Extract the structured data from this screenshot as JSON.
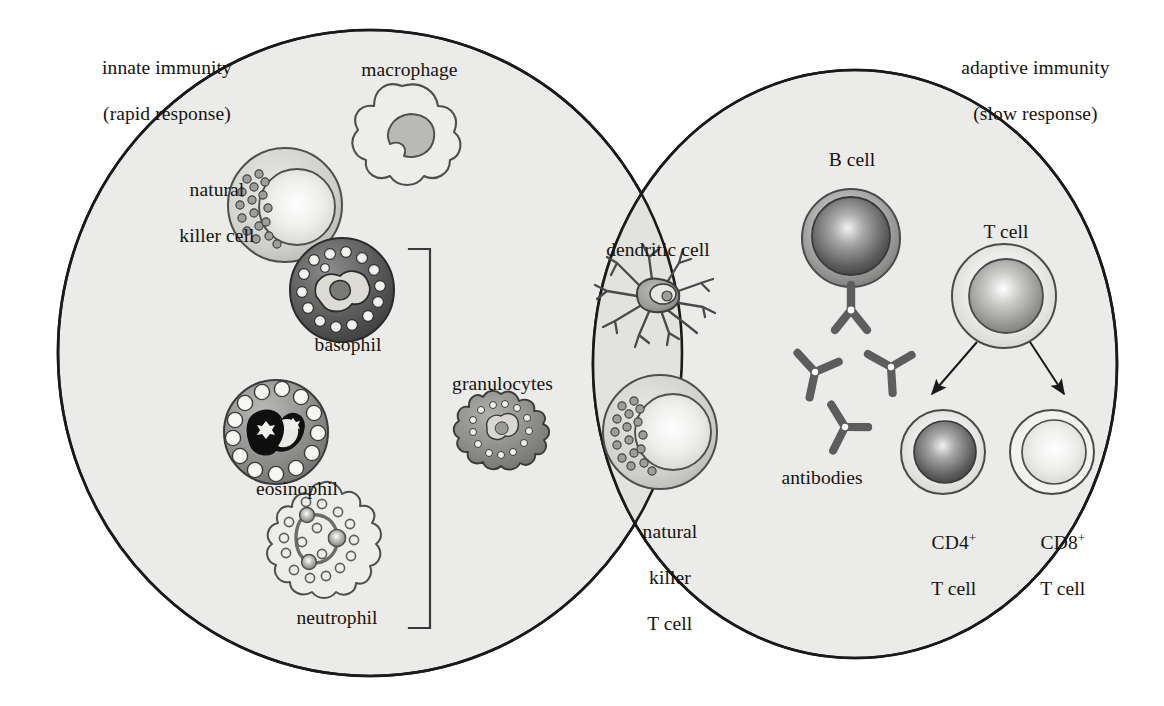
{
  "figure": {
    "background_color": "#ffffff",
    "ellipse_fill": "#ebebe9",
    "overlap_fill": "#e0e0dd",
    "outline_color": "#1a1a1a"
  },
  "regions": {
    "innate": {
      "label_line1": "innate immunity",
      "label_line2": "(rapid response)"
    },
    "adaptive": {
      "label_line1": "adaptive immunity",
      "label_line2": "(slow response)"
    }
  },
  "cells": {
    "macrophage": {
      "label": "macrophage"
    },
    "natural_killer_cell": {
      "label_line1": "natural",
      "label_line2": "killer cell"
    },
    "basophil": {
      "label": "basophil"
    },
    "eosinophil": {
      "label": "eosinophil"
    },
    "neutrophil": {
      "label": "neutrophil"
    },
    "granulocytes": {
      "label": "granulocytes"
    },
    "dendritic_cell": {
      "label": "dendritic cell"
    },
    "natural_killer_t_cell": {
      "label_line1": "natural",
      "label_line2": "killer",
      "label_line3": "T cell"
    },
    "b_cell": {
      "label": "B cell"
    },
    "antibodies": {
      "label": "antibodies"
    },
    "t_cell": {
      "label": "T cell"
    },
    "cd4_t_cell": {
      "label_main": "CD4",
      "label_sup": "+",
      "label_line2": "T cell"
    },
    "cd8_t_cell": {
      "label_main": "CD8",
      "label_sup": "+",
      "label_line2": "T cell"
    }
  },
  "bracket": {
    "name": "granulocytes-bracket",
    "groups": [
      "basophil",
      "eosinophil",
      "neutrophil"
    ]
  },
  "arrows": [
    {
      "from": "t_cell",
      "to": "cd4_t_cell"
    },
    {
      "from": "t_cell",
      "to": "cd8_t_cell"
    }
  ],
  "colors": {
    "cell_dark": "#4a4a4a",
    "cell_mid": "#8a8a8a",
    "cell_light": "#dedede",
    "nucleus_black": "#111111",
    "antibody": "#5a5a5a",
    "granule_white": "#f4f4f2"
  }
}
